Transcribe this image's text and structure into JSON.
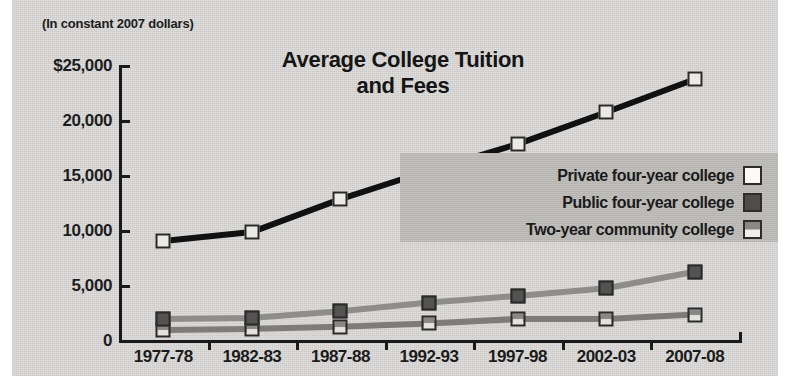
{
  "figure": {
    "subtitle": "(In constant 2007 dollars)",
    "title_line1": "Average College Tuition",
    "title_line2": "and Fees"
  },
  "colors": {
    "background": "#dddcda",
    "legend_panel": "#bdbcb9",
    "ink": "#1a1a1a",
    "private_line": "#111111",
    "private_marker": "#eceae6",
    "public_line": "#8f8d8a",
    "public_marker": "#555352",
    "twoyear_line": "#7e7c79",
    "twoyear_marker": "#e4e2de"
  },
  "chart_data": {
    "type": "line",
    "title": "Average College Tuition and Fees",
    "subtitle": "(In constant 2007 dollars)",
    "xlabel": "",
    "ylabel": "",
    "ylim": [
      0,
      25000
    ],
    "yticks": [
      0,
      5000,
      10000,
      15000,
      20000,
      25000
    ],
    "ytick_labels": [
      "0",
      "5,000",
      "10,000",
      "15,000",
      "20,000",
      "$25,000"
    ],
    "grid": false,
    "legend_position": "middle-right",
    "categories": [
      "1977-78",
      "1982-83",
      "1987-88",
      "1992-93",
      "1997-98",
      "2002-03",
      "2007-08"
    ],
    "series": [
      {
        "name": "Private four-year college",
        "marker": "white-square",
        "values": [
          9100,
          9900,
          12900,
          15500,
          17900,
          20800,
          23800
        ]
      },
      {
        "name": "Public four-year college",
        "marker": "dark-gray-square",
        "values": [
          2000,
          2100,
          2700,
          3500,
          4100,
          4800,
          6300
        ]
      },
      {
        "name": "Two-year community college",
        "marker": "light-gray-square",
        "values": [
          1000,
          1100,
          1300,
          1600,
          2000,
          2000,
          2400
        ]
      }
    ]
  }
}
